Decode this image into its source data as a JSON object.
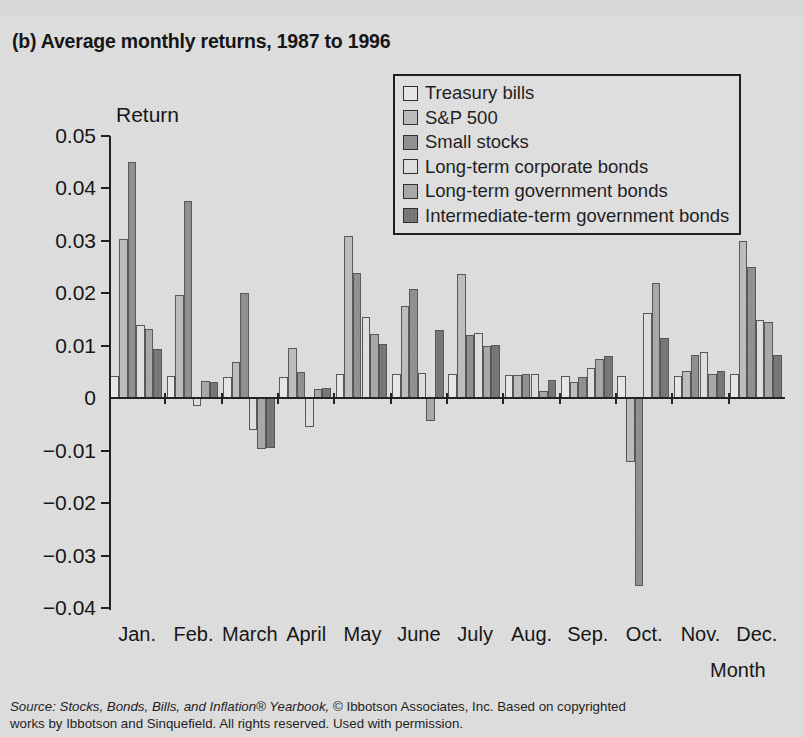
{
  "title": "(b) Average monthly returns, 1987 to 1996",
  "source": {
    "prefix": "Source",
    "italic_part": ": Stocks, Bonds, Bills, and Inflation® Yearbook,",
    "rest": " © Ibbotson Associates, Inc. Based on copyrighted",
    "line2": "works by Ibbotson and Sinquefield. All rights reserved. Used with permission."
  },
  "colors": {
    "background": "#dedede",
    "axis": "#1d1d1d",
    "text": "#111111",
    "series": [
      "#e8e8e8",
      "#bdbdbd",
      "#8f8f8f",
      "#e0e0e0",
      "#a8a8a8",
      "#757575"
    ]
  },
  "chart_data": {
    "type": "bar",
    "title": "(b) Average monthly returns, 1987 to 1996",
    "xlabel": "Month",
    "ylabel": "Return",
    "ylim": [
      -0.04,
      0.05
    ],
    "yticks": [
      0.05,
      0.04,
      0.03,
      0.02,
      0.01,
      0,
      -0.01,
      -0.02,
      -0.03,
      -0.04
    ],
    "ytick_labels": [
      "0.05",
      "0.04",
      "0.03",
      "0.02",
      "0.01",
      "0",
      "−0.01",
      "−0.02",
      "−0.03",
      "−0.04"
    ],
    "grid": false,
    "legend_position": "top-right",
    "categories": [
      "Jan.",
      "Feb.",
      "March",
      "April",
      "May",
      "June",
      "July",
      "Aug.",
      "Sep.",
      "Oct.",
      "Nov.",
      "Dec."
    ],
    "series": [
      {
        "name": "Treasury bills",
        "color": "#e8e8e8",
        "values": [
          0.0042,
          0.0042,
          0.004,
          0.004,
          0.0046,
          0.0046,
          0.0046,
          0.0044,
          0.0042,
          0.0042,
          0.0042,
          0.0046
        ]
      },
      {
        "name": "S&P 500",
        "color": "#bdbdbd",
        "values": [
          0.0303,
          0.0196,
          0.007,
          0.0095,
          0.031,
          0.0176,
          0.0236,
          0.0044,
          0.003,
          -0.0122,
          0.0052,
          0.03
        ]
      },
      {
        "name": "Small stocks",
        "color": "#8f8f8f",
        "values": [
          0.045,
          0.0376,
          0.02,
          0.005,
          0.0239,
          0.0209,
          0.012,
          0.0046,
          0.004,
          -0.0358,
          0.0083,
          0.025
        ]
      },
      {
        "name": "Long-term corporate bonds",
        "color": "#e0e0e0",
        "values": [
          0.014,
          -0.0015,
          -0.006,
          -0.0055,
          0.0155,
          0.0049,
          0.0125,
          0.0046,
          0.0058,
          0.0163,
          0.0088,
          0.015
        ]
      },
      {
        "name": "Long-term government bonds",
        "color": "#a8a8a8",
        "values": [
          0.0132,
          0.0032,
          -0.0097,
          0.0018,
          0.0122,
          -0.0044,
          0.01,
          0.0013,
          0.0074,
          0.022,
          0.0047,
          0.0145
        ]
      },
      {
        "name": "Intermediate-term government bonds",
        "color": "#757575",
        "values": [
          0.0094,
          0.003,
          -0.0094,
          0.002,
          0.0104,
          0.0131,
          0.0101,
          0.0035,
          0.008,
          0.0114,
          0.0051,
          0.0082
        ]
      }
    ]
  }
}
